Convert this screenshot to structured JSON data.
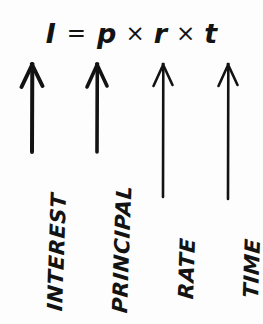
{
  "figure": {
    "kind": "hand-lettered-formula-diagram",
    "background_color": "#fdfdfd",
    "ink_color": "#131313",
    "width": 263,
    "height": 324
  },
  "formula": {
    "full_text": "I = p × r × t",
    "result_variable": "I",
    "equals_sign": "=",
    "multiply_sign": "×",
    "factors": [
      "p",
      "r",
      "t"
    ]
  },
  "variables": [
    {
      "symbol": "I",
      "label": "INTEREST",
      "arrow_x": 32,
      "arrow_tip_y": 64,
      "arrow_tail_y": 152,
      "shaft_width": 4.0,
      "head_width": 21,
      "head_height": 23,
      "label_x": 45,
      "label_y": 310,
      "label_size": 21,
      "label_rotation": -88
    },
    {
      "symbol": "p",
      "label": "PRINCIPAL",
      "arrow_x": 97,
      "arrow_tip_y": 64,
      "arrow_tail_y": 152,
      "shaft_width": 3.6,
      "head_width": 20,
      "head_height": 23,
      "label_x": 110,
      "label_y": 312,
      "label_size": 21,
      "label_rotation": -88
    },
    {
      "symbol": "r",
      "label": "RATE",
      "arrow_x": 163,
      "arrow_tip_y": 64,
      "arrow_tail_y": 197,
      "shaft_width": 2.6,
      "head_width": 19,
      "head_height": 22,
      "label_x": 176,
      "label_y": 298,
      "label_size": 21,
      "label_rotation": -88
    },
    {
      "symbol": "t",
      "label": "TIME",
      "arrow_x": 228,
      "arrow_tip_y": 64,
      "arrow_tail_y": 199,
      "shaft_width": 2.6,
      "head_width": 19,
      "head_height": 22,
      "label_x": 241,
      "label_y": 297,
      "label_size": 21,
      "label_rotation": -88
    }
  ],
  "icons": {
    "arrow": "arrow-up-icon"
  }
}
